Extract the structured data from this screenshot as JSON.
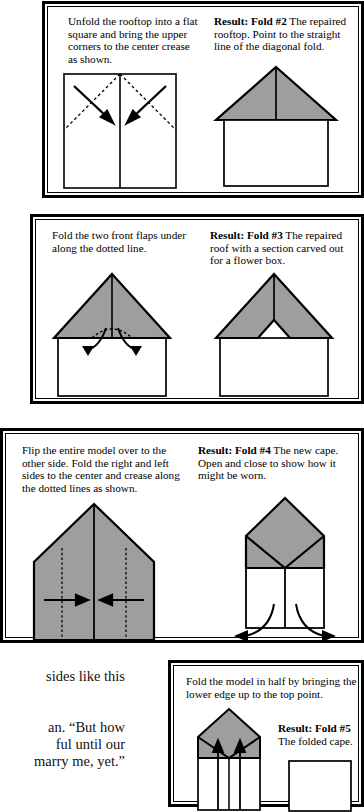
{
  "document": {
    "type": "instructional-origami-page",
    "title": "Paper folding instructions — Folds #2 through #5"
  },
  "margin_text": {
    "fragments_top": [
      "e",
      "-",
      "y",
      "ive",
      "-"
    ],
    "fragments_mid": [
      "nto",
      ", he"
    ],
    "fragments_bottom": [
      "sides like this",
      "an. “But how",
      "ful until our",
      "marry me, yet.”"
    ]
  },
  "panels": [
    {
      "id": "panel-fold-2",
      "instruction": "Unfold the rooftop into a flat square and bring the upper corners to the center crease as shown.",
      "result_label": "Result: Fold #2",
      "result_text": "The repaired rooftop. Point to the straight line of the diagonal fold.",
      "left_figure": "flat-square-with-diagonal-creases",
      "right_figure": "house-with-gray-roof"
    },
    {
      "id": "panel-fold-3",
      "instruction": "Fold the two front flaps under along the dotted line.",
      "result_label": "Result: Fold #3",
      "result_text": "The repaired roof with a section carved out for a flower box.",
      "left_figure": "roof-with-curved-fold-arrows",
      "right_figure": "roof-with-carved-notch"
    },
    {
      "id": "panel-fold-4",
      "instruction": "Flip the entire model over to the other side. Fold the right and left sides to the center and crease along the dotted lines as shown.",
      "result_label": "Result: Fold #4",
      "result_text": "The new cape. Open and close to show how it might be worn.",
      "left_figure": "pentagon-with-inward-arrows",
      "right_figure": "cape-with-outward-arrows"
    },
    {
      "id": "panel-fold-5",
      "instruction": "Fold the model in half by bringing the lower edge up to the top point.",
      "result_label": "Result: Fold #5",
      "result_text": "The folded cape.",
      "left_figure": "cape-with-up-arrows",
      "right_figure": "plain-rectangle"
    }
  ],
  "colors": {
    "paper_fill": "#9e9e9e",
    "ink": "#000000",
    "background": "#ffffff"
  }
}
